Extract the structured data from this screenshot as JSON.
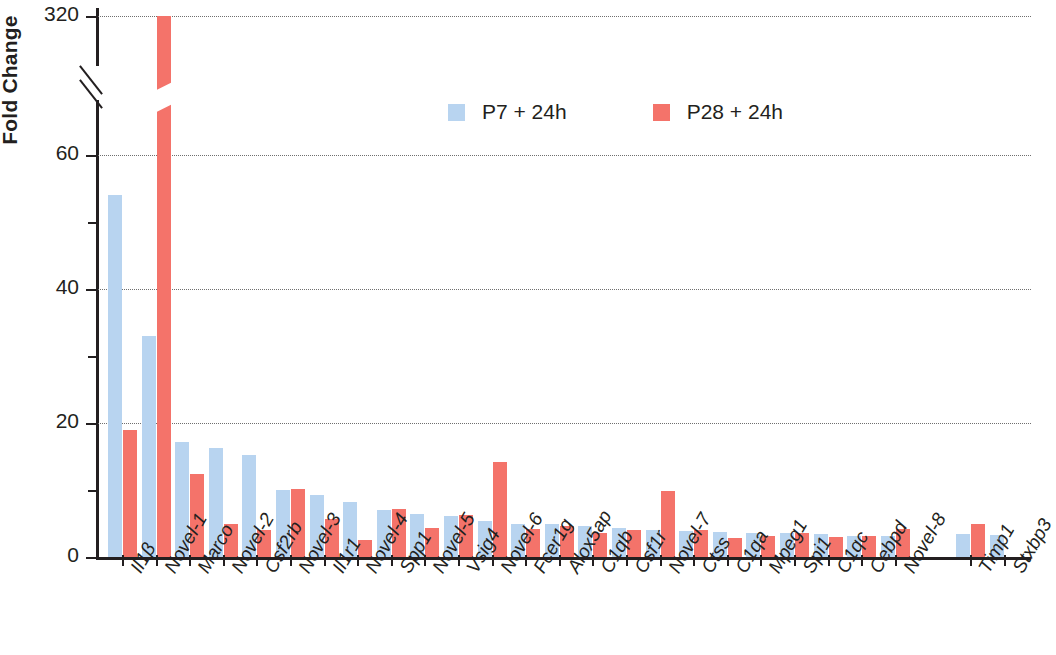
{
  "chart_data": {
    "type": "bar",
    "title": "",
    "xlabel": "",
    "ylabel": "Fold Change",
    "ylim": [
      0,
      320
    ],
    "y_ticks_major": [
      0,
      20,
      40,
      60,
      320
    ],
    "y_ticks_minor": [
      10,
      30,
      50
    ],
    "axis_break": true,
    "axis_break_note": "Y axis broken between 60 and 320",
    "grid": "horizontal dotted at 20, 40, 60, 320",
    "legend_position": "top-center",
    "categories": [
      "Il1β",
      "Novel-1",
      "Marco",
      "Novel-2",
      "Csf2rb",
      "Novel-3",
      "Il1r1",
      "Novel-4",
      "Spp1",
      "Novel-5",
      "Vsig4",
      "Novel-6",
      "Fcer1g",
      "Alox5ap",
      "C1qb",
      "Csf1r",
      "Novel-7",
      "Ctss",
      "C1qa",
      "Mpeg1",
      "Spi1",
      "C1qc",
      "Cebpd",
      "Novel-8",
      "Timp1",
      "Stxbp3"
    ],
    "category_gap_after": "Novel-8",
    "series": [
      {
        "name": "P7 + 24h",
        "color": "#b8d4f0",
        "values": [
          54,
          33,
          17.2,
          16.2,
          15.2,
          10,
          9.2,
          8.2,
          7,
          6.4,
          6.1,
          5.4,
          5,
          4.9,
          4.6,
          4.3,
          4.1,
          3.9,
          3.7,
          3.6,
          3.6,
          3.4,
          3.1,
          3.1,
          3.5,
          3.3
        ]
      },
      {
        "name": "P28 + 24h",
        "color": "#f4736a",
        "values": [
          19,
          320,
          12.4,
          4.9,
          4.1,
          10.2,
          5.6,
          2.6,
          7.2,
          4.3,
          6.2,
          14.2,
          4.2,
          4.6,
          3.6,
          4,
          9.8,
          4,
          2.8,
          3.1,
          3.6,
          3,
          3.2,
          4.2,
          5,
          null
        ]
      }
    ],
    "broken_bar": {
      "category": "Novel-1",
      "series": "P28 + 24h",
      "value": 320
    }
  },
  "axis": {
    "y_title": "Fold Change",
    "y_tick_labels": [
      "320",
      "60",
      "40",
      "20",
      "0"
    ]
  },
  "legend": {
    "items": [
      {
        "label": "P7 + 24h",
        "color": "#b8d4f0"
      },
      {
        "label": "P28 + 24h",
        "color": "#f4736a"
      }
    ]
  },
  "colors": {
    "series_p7": "#b8d4f0",
    "series_p28": "#f4736a",
    "axis": "#231f20",
    "grid": "#6f6f6f",
    "background": "#ffffff"
  }
}
